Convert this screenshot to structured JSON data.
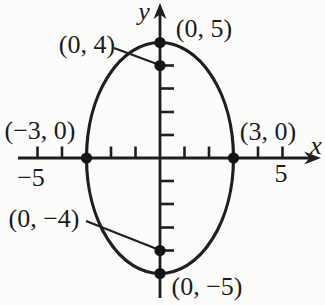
{
  "figure": {
    "kind": "ellipse-coordinate-graph",
    "background_color": "#fcfcfa",
    "ink_color": "#1f1f1f"
  },
  "axes": {
    "x_label": "x",
    "y_label": "y",
    "x_tick_label_neg": "−5",
    "x_tick_label_pos": "5"
  },
  "point_labels": {
    "p_0_5": "(0, 5)",
    "p_0_4": "(0, 4)",
    "p_neg3_0": "(−3, 0)",
    "p_3_0": "(3, 0)",
    "p_0_neg4": "(0, −4)",
    "p_0_neg5": "(0, −5)"
  },
  "graph": {
    "curve": "ellipse",
    "center": [
      0,
      0
    ],
    "semi_axis_x": 3,
    "semi_axis_y": 5,
    "marked_points": [
      [
        0,
        5
      ],
      [
        0,
        4
      ],
      [
        -3,
        0
      ],
      [
        3,
        0
      ],
      [
        0,
        -4
      ],
      [
        0,
        -5
      ]
    ],
    "x_ticks_shown": [
      -5,
      -4,
      -2,
      -1,
      1,
      2,
      4,
      5
    ],
    "y_ticks_shown": [
      -4,
      -3,
      -2,
      -1,
      1,
      2,
      3,
      4
    ],
    "labeled_x_ticks": [
      -5,
      5
    ],
    "leader_lines": [
      "label (0, 4) to point (0, 4)",
      "label (0, −4) to point (0, −4)"
    ]
  }
}
